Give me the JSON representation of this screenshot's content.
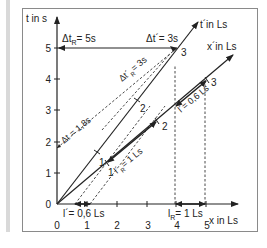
{
  "diagram": {
    "axes": {
      "t_label": "t in s",
      "x_label": "x in Ls",
      "tprime_label": "t´in Ls",
      "xprime_label": "x´in Ls",
      "t_ticks": [
        "0",
        "1",
        "2",
        "3",
        "4",
        "5"
      ],
      "x_ticks": [
        "0",
        "1",
        "2",
        "3",
        "4",
        "5"
      ],
      "tprime_ticks": [
        "1",
        "2",
        "3"
      ],
      "xprime_ticks": [
        "1",
        "2",
        "3"
      ]
    },
    "annotations": {
      "delta_t_R": "Δt",
      "delta_t_R_sub": "R",
      "delta_t_R_val": "= 5s",
      "delta_t_prime": "Δt´= 3s",
      "delta_t_prime_R": "Δt´",
      "delta_t_prime_R_sub": "R",
      "delta_t_prime_R_val": "= 3s",
      "delta_t": "Δt = 1,8s",
      "l_prime_R": "l´",
      "l_prime_R_sub": "R",
      "l_prime_R_val": "= 1 Ls",
      "l_prime_diag": "l´= 0,6 Ls",
      "l_prime_bottom": "l´= 0,6 Ls",
      "l_R": "l",
      "l_R_sub": "R",
      "l_R_val": "= 1 Ls"
    },
    "colors": {
      "line": "#222222",
      "frame": "#8a8a8a",
      "sidebar": "#d9d9d9"
    }
  }
}
